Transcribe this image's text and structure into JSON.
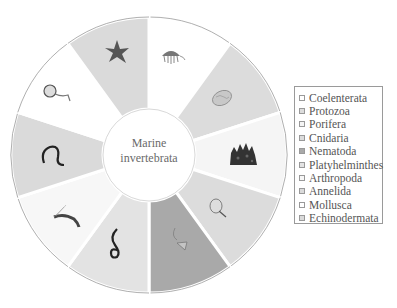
{
  "diagram": {
    "center_label_line1": "Marine",
    "center_label_line2": "invertebrata",
    "wheel": {
      "center": [
        149,
        155
      ],
      "outer_radius": 138,
      "inner_radius": 46,
      "segments": [
        {
          "start": -90,
          "end": -54,
          "fill": "#ffffff",
          "icon": "jellyfish-icon"
        },
        {
          "start": -54,
          "end": -18,
          "fill": "#dcdcdc",
          "icon": "protozoa-icon"
        },
        {
          "start": -18,
          "end": 18,
          "fill": "#f5f5f5",
          "icon": "sponge-coral-icon"
        },
        {
          "start": 18,
          "end": 54,
          "fill": "#dcdcdc",
          "icon": "small-jellyfish-icon"
        },
        {
          "start": 54,
          "end": 90,
          "fill": "#a9a9a9",
          "icon": "nematode-icon"
        },
        {
          "start": 90,
          "end": 126,
          "fill": "#e3e3e3",
          "icon": "flatworm-icon"
        },
        {
          "start": 126,
          "end": 162,
          "fill": "#f7f7f7",
          "icon": "shrimp-icon"
        },
        {
          "start": 162,
          "end": 198,
          "fill": "#dadada",
          "icon": "annelid-worm-icon"
        },
        {
          "start": 198,
          "end": 234,
          "fill": "#ffffff",
          "icon": "snail-icon"
        },
        {
          "start": 234,
          "end": 270,
          "fill": "#dadada",
          "icon": "starfish-icon"
        }
      ]
    }
  },
  "legend": {
    "items": [
      {
        "label": "Coelenterata",
        "color": "#ffffff"
      },
      {
        "label": "Protozoa",
        "color": "#dcdcdc"
      },
      {
        "label": "Porifera",
        "color": "#f5f5f5"
      },
      {
        "label": "Cnidaria",
        "color": "#dcdcdc"
      },
      {
        "label": "Nematoda",
        "color": "#a9a9a9"
      },
      {
        "label": "Platyhelminthes",
        "color": "#e3e3e3"
      },
      {
        "label": "Arthropoda",
        "color": "#f7f7f7"
      },
      {
        "label": "Annelida",
        "color": "#dadada"
      },
      {
        "label": "Mollusca",
        "color": "#ffffff"
      },
      {
        "label": "Echinodermata",
        "color": "#dadada"
      }
    ]
  }
}
